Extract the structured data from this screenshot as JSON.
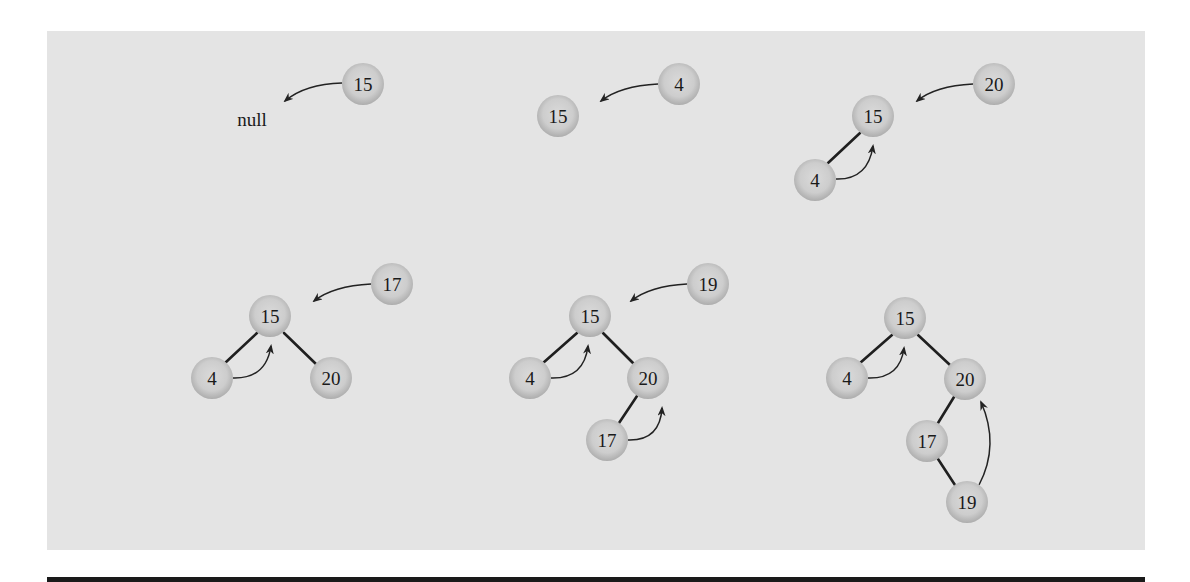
{
  "figure": {
    "colors": {
      "panel_background": "#e4e4e4",
      "node_fill_center": "#d9d9d9",
      "node_fill_edge": "#b5b5b5",
      "edge_color": "#1f1f1f",
      "text_color": "#1a1a1a",
      "bottom_bar": "#1a1a1a"
    },
    "null_label": "null",
    "steps": [
      {
        "step": 1,
        "inserting": "15",
        "tree_before": [],
        "null_text": "null"
      },
      {
        "step": 2,
        "inserting": "4",
        "tree_before": [
          "15"
        ]
      },
      {
        "step": 3,
        "inserting": "20",
        "tree_before": [
          "15",
          "4"
        ]
      },
      {
        "step": 4,
        "inserting": "17",
        "tree_before": [
          "15",
          "4",
          "20"
        ]
      },
      {
        "step": 5,
        "inserting": "19",
        "tree_before": [
          "15",
          "4",
          "20",
          "17"
        ]
      },
      {
        "step": 6,
        "inserting": null,
        "tree_before": [
          "15",
          "4",
          "20",
          "17",
          "19"
        ]
      }
    ]
  },
  "labels": {
    "d1": {
      "new": "15",
      "null": "null"
    },
    "d2": {
      "new": "4",
      "root": "15"
    },
    "d3": {
      "new": "20",
      "root": "15",
      "left": "4"
    },
    "d4": {
      "new": "17",
      "root": "15",
      "left": "4",
      "right": "20"
    },
    "d5": {
      "new": "19",
      "root": "15",
      "left": "4",
      "right": "20",
      "rl": "17"
    },
    "d6": {
      "root": "15",
      "left": "4",
      "right": "20",
      "rl": "17",
      "rlr": "19"
    }
  }
}
